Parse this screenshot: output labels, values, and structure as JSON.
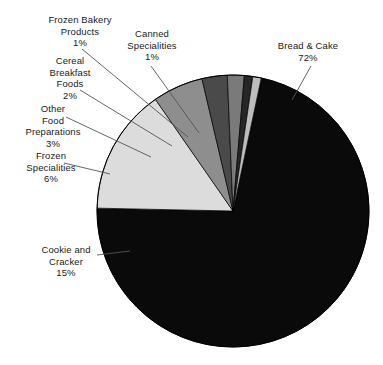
{
  "chart_data": {
    "type": "pie",
    "title": "",
    "subtitle": "",
    "xlabel": "",
    "ylabel": "",
    "legend_position": "none",
    "grid": false,
    "value_unit": "percent",
    "categories": [
      "Bread & Cake",
      "Cookie and Cracker",
      "Frozen Specialities",
      "Other Food Preparations",
      "Cereal Breakfast Foods",
      "Frozen Bakery Products",
      "Canned Specialities"
    ],
    "values": [
      72,
      15,
      6,
      3,
      2,
      1,
      1
    ],
    "slices": [
      {
        "label": "Bread & Cake",
        "value": 72,
        "value_text": "72%",
        "color": "#0a0a0a"
      },
      {
        "label": "Cookie and Cracker",
        "value": 15,
        "value_text": "15%",
        "color": "#dcdcdc"
      },
      {
        "label": "Frozen Specialities",
        "value": 6,
        "value_text": "6%",
        "color": "#8e8e8e"
      },
      {
        "label": "Other Food Preparations",
        "value": 3,
        "value_text": "3%",
        "color": "#4a4a4a"
      },
      {
        "label": "Cereal Breakfast Foods",
        "value": 2,
        "value_text": "2%",
        "color": "#7a7a7a"
      },
      {
        "label": "Frozen Bakery Products",
        "value": 1,
        "value_text": "1%",
        "color": "#262626"
      },
      {
        "label": "Canned Specialities",
        "value": 1,
        "value_text": "1%",
        "color": "#bdbdbd"
      }
    ]
  },
  "labels": {
    "bread_cake": "Bread & Cake\n72%",
    "cookie_cracker": "Cookie and\nCracker\n15%",
    "frozen_spec": "Frozen\nSpecialities\n6%",
    "other_food": "Other\nFood\nPreparations\n3%",
    "cereal_breakfast": "Cereal\nBreakfast\nFoods\n2%",
    "frozen_bakery": "Frozen Bakery\nProducts\n1%",
    "canned_spec": "Canned\nSpecialities\n1%"
  },
  "style": {
    "background": "#ffffff",
    "outline": "#000000",
    "leader_line": "#555555"
  }
}
